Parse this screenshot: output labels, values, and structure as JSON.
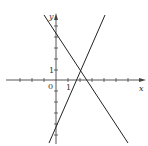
{
  "figure": {
    "type": "coordinate-plane",
    "axes": {
      "x_label": "x",
      "y_label": "y",
      "origin_label": "0",
      "x_unit_label": "1",
      "y_unit_label": "1"
    },
    "lines": [
      {
        "name": "decreasing-line",
        "description": "line with negative slope, y-intercept near 4",
        "equation_approx": "y = -1.5x + 4"
      },
      {
        "name": "increasing-line",
        "description": "line with positive slope, y-intercept near -4",
        "equation_approx": "y = 2.5x - 4"
      }
    ],
    "intersection_approx": [
      2,
      1
    ],
    "colors": {
      "axis": "#444444",
      "line": "#222222",
      "background": "#ffffff"
    }
  }
}
